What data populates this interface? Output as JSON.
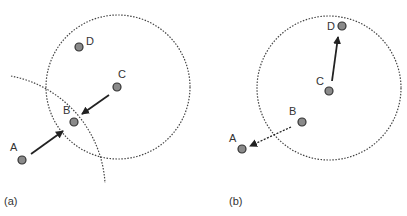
{
  "panels": [
    {
      "caption": "(a)",
      "nodes": [
        {
          "id": "A",
          "label": "A"
        },
        {
          "id": "B",
          "label": "B"
        },
        {
          "id": "C",
          "label": "C"
        },
        {
          "id": "D",
          "label": "D"
        }
      ],
      "edges": [
        {
          "from": "A",
          "to": "B",
          "style": "solid"
        },
        {
          "from": "C",
          "to": "B",
          "style": "solid"
        }
      ]
    },
    {
      "caption": "(b)",
      "nodes": [
        {
          "id": "A",
          "label": "A"
        },
        {
          "id": "B",
          "label": "B"
        },
        {
          "id": "C",
          "label": "C"
        },
        {
          "id": "D",
          "label": "D"
        }
      ],
      "edges": [
        {
          "from": "C",
          "to": "D",
          "style": "solid"
        },
        {
          "from": "B",
          "to": "A",
          "style": "dashed"
        }
      ]
    }
  ],
  "colors": {
    "node_fill": "#8a8a8a",
    "node_stroke": "#333333",
    "line": "#222222"
  }
}
